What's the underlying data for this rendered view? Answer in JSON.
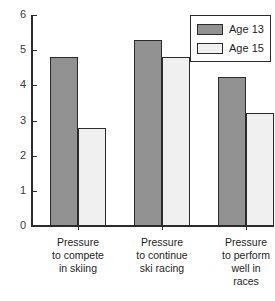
{
  "chart_data": {
    "type": "bar",
    "title": "",
    "subtitle": "",
    "xlabel": "",
    "ylabel": "",
    "ylim": [
      0,
      6
    ],
    "grid": false,
    "legend_position": "top-right",
    "categories": [
      "Pressure to compete in skiing",
      "Pressure to continue ski racing",
      "Pressure to perform well in races"
    ],
    "category_lines": [
      [
        "Pressure",
        "to compete",
        "in skiing"
      ],
      [
        "Pressure",
        "to continue",
        "ski racing"
      ],
      [
        "Pressure",
        "to perform",
        "well in",
        "races"
      ]
    ],
    "series": [
      {
        "name": "Age 13",
        "color": "#929292",
        "values": [
          4.8,
          5.3,
          4.25
        ]
      },
      {
        "name": "Age 15",
        "color": "#f0f0f0",
        "values": [
          2.8,
          4.8,
          3.2
        ]
      }
    ],
    "y_ticks": [
      0,
      1,
      2,
      3,
      4,
      5,
      6
    ],
    "y_tick_labels": [
      "0",
      "1",
      "2",
      "3",
      "4",
      "5",
      "6"
    ]
  },
  "legend": {
    "entries": [
      {
        "label": "Age 13",
        "swatch": "dark"
      },
      {
        "label": "Age 15",
        "swatch": "light"
      }
    ]
  },
  "colors": {
    "age13": "#929292",
    "age15": "#f0f0f0",
    "axis": "#2b2b2b",
    "text": "#1e1e1e",
    "background": "#ffffff"
  }
}
